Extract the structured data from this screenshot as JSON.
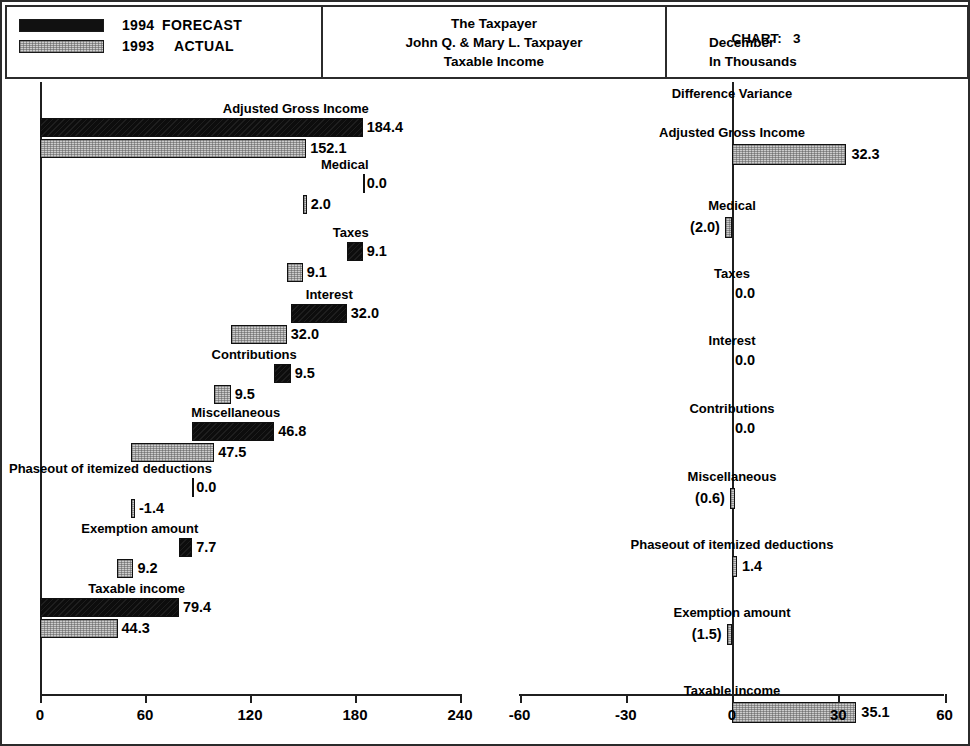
{
  "legend": {
    "items": [
      {
        "swatch": "black",
        "year": "1994",
        "kind": "FORECAST"
      },
      {
        "swatch": "gray",
        "year": "1993",
        "kind": "ACTUAL"
      }
    ]
  },
  "title_box": {
    "line1": "The Taxpayer",
    "line2": "John Q. & Mary L. Taxpayer",
    "line3": "Taxable Income"
  },
  "chart_info": {
    "chart_label": "CHART:",
    "chart_number": "3",
    "period": "December",
    "units": "In Thousands"
  },
  "right_panel_heading": "Difference Variance",
  "chart_data": [
    {
      "type": "bar",
      "id": "waterfall-left",
      "title": "Taxable Income",
      "orientation": "horizontal",
      "grid": false,
      "xlabel": "",
      "ylabel": "",
      "xlim": [
        0,
        240
      ],
      "xticks": [
        0,
        60,
        120,
        180,
        240
      ],
      "xtick_labels": [
        "0",
        "60",
        "120",
        "180",
        "240"
      ],
      "legend_position": "top-left",
      "series": [
        {
          "name": "1994 FORECAST",
          "color": "#0d0d0d"
        },
        {
          "name": "1993 ACTUAL",
          "color": "#cccccc"
        }
      ],
      "categories": [
        "Adjusted Gross Income",
        "Medical",
        "Taxes",
        "Interest",
        "Contributions",
        "Miscellaneous",
        "Phaseout of itemized deductions",
        "Exemption amount",
        "Taxable income"
      ],
      "rows": [
        {
          "label": "Adjusted Gross Income",
          "fc_value": "184.4",
          "fc_start": 0.0,
          "fc_end": 184.4,
          "ac_value": "152.1",
          "ac_start": 0.0,
          "ac_end": 152.1
        },
        {
          "label": "Medical",
          "fc_value": "0.0",
          "fc_start": 184.4,
          "fc_end": 184.4,
          "ac_value": "2.0",
          "ac_start": 150.1,
          "ac_end": 152.1
        },
        {
          "label": "Taxes",
          "fc_value": "9.1",
          "fc_start": 175.3,
          "fc_end": 184.4,
          "ac_value": "9.1",
          "ac_start": 141.0,
          "ac_end": 150.1
        },
        {
          "label": "Interest",
          "fc_value": "32.0",
          "fc_start": 143.3,
          "fc_end": 175.3,
          "ac_value": "32.0",
          "ac_start": 109.0,
          "ac_end": 141.0
        },
        {
          "label": "Contributions",
          "fc_value": "9.5",
          "fc_start": 133.8,
          "fc_end": 143.3,
          "ac_value": "9.5",
          "ac_start": 99.5,
          "ac_end": 109.0
        },
        {
          "label": "Miscellaneous",
          "fc_value": "46.8",
          "fc_start": 87.0,
          "fc_end": 133.8,
          "ac_value": "47.5",
          "ac_start": 52.0,
          "ac_end": 99.5
        },
        {
          "label": "Phaseout of itemized deductions",
          "fc_value": "0.0",
          "fc_start": 87.0,
          "fc_end": 87.0,
          "ac_value": "-1.4",
          "ac_start": 52.0,
          "ac_end": 53.4
        },
        {
          "label": "Exemption amount",
          "fc_value": "7.7",
          "fc_start": 79.3,
          "fc_end": 87.0,
          "ac_value": "9.2",
          "ac_start": 44.2,
          "ac_end": 53.4
        },
        {
          "label": "Taxable income",
          "fc_value": "79.4",
          "fc_start": 0.0,
          "fc_end": 79.4,
          "ac_value": "44.3",
          "ac_start": 0.0,
          "ac_end": 44.3
        }
      ]
    },
    {
      "type": "bar",
      "id": "variance-right",
      "title": "Difference Variance",
      "orientation": "horizontal",
      "grid": false,
      "xlabel": "",
      "ylabel": "",
      "xlim": [
        -60,
        60
      ],
      "xticks": [
        -60,
        -30,
        0,
        30,
        60
      ],
      "xtick_labels": [
        "-60",
        "-30",
        "0",
        "30",
        "60"
      ],
      "legend_position": "none",
      "categories": [
        "Adjusted Gross Income",
        "Medical",
        "Taxes",
        "Interest",
        "Contributions",
        "Miscellaneous",
        "Phaseout of itemized deductions",
        "Exemption amount",
        "Taxable income"
      ],
      "values": [
        32.3,
        -2.0,
        0.0,
        0.0,
        0.0,
        -0.6,
        1.4,
        -1.5,
        35.1
      ],
      "value_labels": [
        "32.3",
        "(2.0)",
        "0.0",
        "0.0",
        "0.0",
        "(0.6)",
        "1.4",
        "(1.5)",
        "35.1"
      ]
    }
  ]
}
